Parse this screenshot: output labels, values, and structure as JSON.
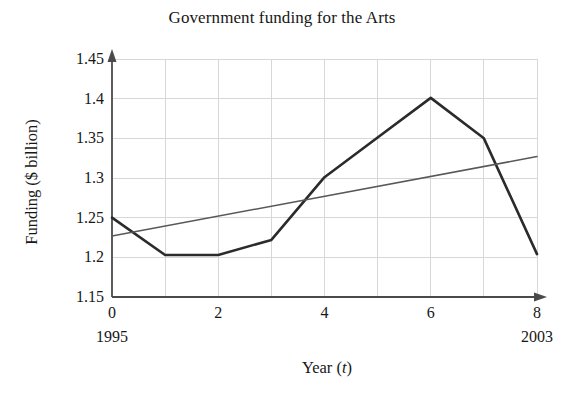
{
  "chart_data": {
    "type": "line",
    "title": "Government funding for the Arts",
    "xlabel": "Year (t)",
    "xlabel_main": "Year (",
    "xlabel_var": "t",
    "xlabel_close": ")",
    "ylabel": "Funding ($ billion)",
    "xlim": [
      0,
      8
    ],
    "ylim": [
      1.15,
      1.45
    ],
    "grid": true,
    "legend": "none",
    "x_ticks": [
      "0",
      "2",
      "4",
      "6",
      "8"
    ],
    "x_tick_values": [
      0,
      2,
      4,
      6,
      8
    ],
    "y_ticks": [
      "1.15",
      "1.2",
      "1.25",
      "1.3",
      "1.35",
      "1.4",
      "1.45"
    ],
    "y_tick_values": [
      1.15,
      1.2,
      1.25,
      1.3,
      1.35,
      1.4,
      1.45
    ],
    "x_annotations": [
      {
        "at": 0,
        "text": "1995"
      },
      {
        "at": 8,
        "text": "2003"
      }
    ],
    "x": [
      0,
      1,
      2,
      3,
      4,
      5,
      6,
      7,
      8
    ],
    "series": [
      {
        "name": "Funding data",
        "color": "#2b2b2b",
        "width": 2.6,
        "values": [
          1.25,
          1.203,
          1.203,
          1.222,
          1.301,
          1.351,
          1.401,
          1.35,
          1.204
        ]
      },
      {
        "name": "Linear trend",
        "color": "#585858",
        "width": 1.5,
        "x": [
          0,
          8
        ],
        "values": [
          1.227,
          1.327
        ]
      }
    ]
  },
  "axes": {
    "x_axis_arrow": true,
    "y_axis_arrow": true,
    "axis_color": "#4a4a4a",
    "grid_color": "#d7d7d7"
  }
}
